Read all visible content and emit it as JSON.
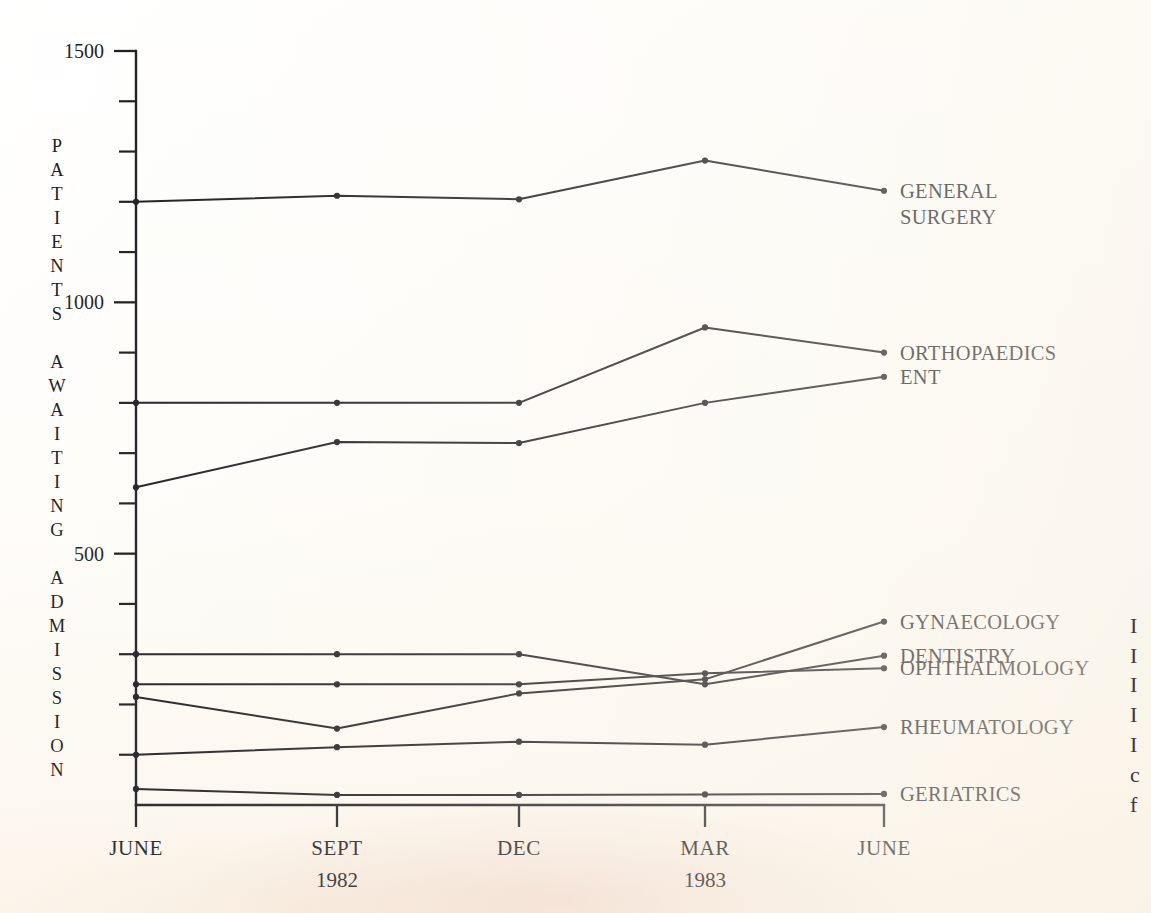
{
  "chart_data": {
    "type": "line",
    "title": "",
    "xlabel": "",
    "ylabel": "PATIENTS AWAITING ADMISSION",
    "categories": [
      "JUNE",
      "SEPT",
      "DEC",
      "MAR",
      "JUNE"
    ],
    "category_sublabels": [
      "",
      "1982",
      "",
      "1983",
      ""
    ],
    "ylim": [
      0,
      1500
    ],
    "ytick_major": [
      500,
      1000,
      1500
    ],
    "ytick_major_labels": [
      "500",
      "1000",
      "1500"
    ],
    "ytick_minor": [
      100,
      200,
      300,
      400,
      600,
      700,
      800,
      900,
      1100,
      1200,
      1300,
      1400
    ],
    "grid": false,
    "legend_position": "right-inline",
    "series": [
      {
        "name": "GENERAL SURGERY",
        "label_lines": [
          "GENERAL",
          "SURGERY"
        ],
        "values": [
          1200,
          1212,
          1205,
          1282,
          1222
        ]
      },
      {
        "name": "ORTHOPAEDICS",
        "label_lines": [
          "ORTHOPAEDICS"
        ],
        "values": [
          800,
          800,
          800,
          950,
          900
        ]
      },
      {
        "name": "ENT",
        "label_lines": [
          "ENT"
        ],
        "values": [
          632,
          722,
          720,
          800,
          852
        ]
      },
      {
        "name": "GYNAECOLOGY",
        "label_lines": [
          "GYNAECOLOGY"
        ],
        "values": [
          215,
          152,
          222,
          250,
          365
        ]
      },
      {
        "name": "DENTISTRY",
        "label_lines": [
          "DENTISTRY"
        ],
        "values": [
          300,
          300,
          300,
          240,
          297
        ]
      },
      {
        "name": "OPHTHALMOLOGY",
        "label_lines": [
          "OPHTHALMOLOGY"
        ],
        "values": [
          240,
          240,
          240,
          262,
          272
        ]
      },
      {
        "name": "RHEUMATOLOGY",
        "label_lines": [
          "RHEUMATOLOGY"
        ],
        "values": [
          100,
          115,
          126,
          120,
          155
        ]
      },
      {
        "name": "GERIATRICS",
        "label_lines": [
          "GERIATRICS"
        ],
        "values": [
          32,
          20,
          20,
          21,
          22
        ]
      }
    ]
  },
  "axis": {
    "vertical_title_letters": [
      "P",
      "A",
      "T",
      "I",
      "E",
      "N",
      "T",
      "S",
      "",
      "A",
      "W",
      "A",
      "I",
      "T",
      "I",
      "N",
      "G",
      "",
      "A",
      "D",
      "M",
      "I",
      "S",
      "S",
      "I",
      "O",
      "N"
    ]
  },
  "edge_fragments": [
    "I",
    "I",
    "I",
    "I",
    "I",
    "c",
    "f"
  ],
  "colors": {
    "ink": "#16161a",
    "paper": "#fdfcf7",
    "stain": "#e0a696"
  }
}
